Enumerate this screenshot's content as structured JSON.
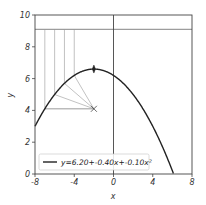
{
  "chart_data": {
    "type": "line",
    "title": "",
    "xlabel": "x",
    "ylabel": "y",
    "xlim": [
      -8,
      8
    ],
    "ylim": [
      0,
      10
    ],
    "xticks": [
      -8,
      -4,
      0,
      4,
      8
    ],
    "xtick_labels": [
      "-8",
      "-4",
      "0",
      "4",
      "8"
    ],
    "yticks": [
      0,
      2,
      4,
      6,
      8,
      10
    ],
    "ytick_labels": [
      "0",
      "2",
      "4",
      "6",
      "8",
      "10"
    ],
    "grid": false,
    "legend_position": "lower left",
    "series": [
      {
        "name": "y=6.20+-0.40x+-0.10x²",
        "equation": {
          "a0": 6.2,
          "a1": -0.4,
          "a2": -0.1
        },
        "color": "#222222"
      }
    ],
    "annotations": {
      "vertex_marker": {
        "x": -2,
        "y": 6.6,
        "marker": "thin-diamond"
      },
      "focus_marker": {
        "x": -2,
        "y": 4.1,
        "marker": "x"
      },
      "directrix_y": 9.1,
      "vertical_x_axis_line": 0,
      "sample_points_x": [
        -7,
        -6,
        -5,
        -4
      ],
      "horizontal_guide": {
        "y": 4.1,
        "x_from": -7,
        "x_to": -2
      }
    },
    "colors": {
      "curve": "#222222",
      "guide": "#999999",
      "axis": "#444444"
    }
  }
}
